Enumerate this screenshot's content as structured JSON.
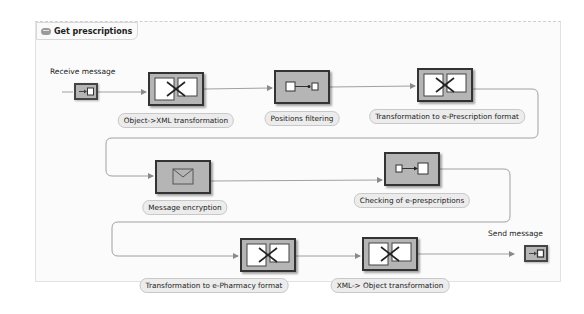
{
  "process": {
    "title": "Get prescriptions",
    "title_icon": "process-icon"
  },
  "events": {
    "start": {
      "label": "Receive message",
      "icon": "receive-message-icon"
    },
    "end": {
      "label": "Send message",
      "icon": "send-message-icon"
    }
  },
  "steps": [
    {
      "id": "object-xml",
      "label": "Object->XML transformation",
      "icon": "transformation-icon"
    },
    {
      "id": "positions-filtering",
      "label": "Positions filtering",
      "icon": "filter-icon"
    },
    {
      "id": "transform-eprescription",
      "label": "Transformation to e-Prescription format",
      "icon": "transformation-icon"
    },
    {
      "id": "message-encryption",
      "label": "Message encryption",
      "icon": "envelope-icon"
    },
    {
      "id": "checking-eprescriptions",
      "label": "Checking of e-prespcriptions",
      "icon": "check-flow-icon"
    },
    {
      "id": "transform-epharmacy",
      "label": "Transformation to e-Pharmacy format",
      "icon": "transformation-icon"
    },
    {
      "id": "xml-object",
      "label": "XML-> Object transformation",
      "icon": "transformation-icon"
    }
  ],
  "colors": {
    "node_fill": "#b5b5b5",
    "node_border": "#333333",
    "pill_fill": "#ececec",
    "wire": "#9a9a9a"
  }
}
